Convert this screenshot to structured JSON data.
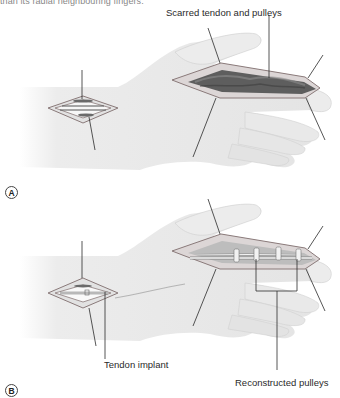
{
  "page": {
    "top_text": "than its radial neighbouring fingers."
  },
  "figure": {
    "panels": [
      {
        "id": "A",
        "badge": "A",
        "labels": [
          {
            "text": "Scarred tendon and pulleys"
          }
        ]
      },
      {
        "id": "B",
        "badge": "B",
        "labels": [
          {
            "text": "Tendon implant"
          },
          {
            "text": "Reconstructed pulleys"
          }
        ]
      }
    ]
  },
  "colors": {
    "skin_fill": "#ececec",
    "skin_shade": "#d6d6d6",
    "outline": "#8a8a8a",
    "incision_edge": "#7a6f6f",
    "scar_tissue": "#5e5e5e",
    "tendon": "#f4f4f4",
    "retractor_line": "#2b2b2b"
  }
}
